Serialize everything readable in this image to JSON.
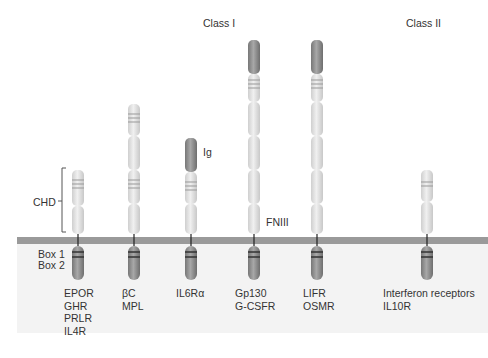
{
  "class_labels": {
    "class1": "Class I",
    "class2": "Class II"
  },
  "domain_labels": {
    "chd": "CHD",
    "ig": "Ig",
    "fniii": "FNIII",
    "box1": "Box 1",
    "box2": "Box 2"
  },
  "receptors": [
    {
      "id": "epor",
      "names": [
        "EPOR",
        "GHR",
        "PRLR",
        "IL4R"
      ]
    },
    {
      "id": "bc",
      "names": [
        "βC",
        "MPL"
      ]
    },
    {
      "id": "il6ra",
      "names": [
        "IL6Rα"
      ]
    },
    {
      "id": "gp130",
      "names": [
        "Gp130",
        "G-CSFR"
      ]
    },
    {
      "id": "lifr",
      "names": [
        "LIFR",
        "OSMR"
      ]
    },
    {
      "id": "ifnr",
      "names": [
        "Interferon receptors",
        "IL10R"
      ]
    }
  ],
  "colors": {
    "light_domain": "#e4e4e4",
    "dark_domain": "#8a8a8a",
    "membrane": "#9a9a9a",
    "cytoplasm": "#f3f3f3"
  }
}
